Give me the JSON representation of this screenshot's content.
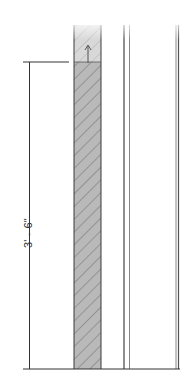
{
  "drawing": {
    "type": "architectural-section-detail",
    "dimension": {
      "label": "3' - 6\"",
      "orientation": "vertical"
    },
    "colors": {
      "line": "#333333",
      "hatch_fill": "#b8b8b8",
      "hatch_stroke": "#6e6e6e",
      "background": "#ffffff"
    },
    "elements": [
      {
        "name": "hatched-wall",
        "description": "cut section with diagonal hatching"
      },
      {
        "name": "double-line-stud",
        "description": "thin double vertical lines"
      },
      {
        "name": "right-edge-line",
        "description": "vertical line at right"
      },
      {
        "name": "level-arrow",
        "description": "small upward arrow at top of wall"
      }
    ]
  }
}
